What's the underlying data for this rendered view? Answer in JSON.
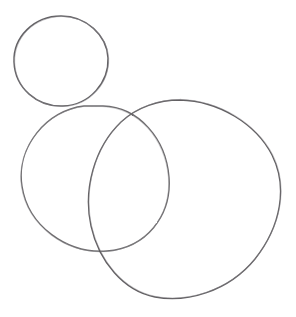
{
  "document": {
    "kind": "pencil-sketch",
    "title": "Three overlapping hand-drawn circles",
    "medium": "graphite pencil on paper",
    "width": 296,
    "height": 317,
    "background_color": "#ffffff",
    "paper_tint": "#fdfdfd",
    "stroke_color": "#5a585a",
    "stroke_color_light": "#8b898c",
    "stroke_width": 1.3
  },
  "shapes": [
    {
      "id": "small-circle",
      "name": "small-circle-top-left",
      "label": "Small circle (head)",
      "type": "circle",
      "cx": 61,
      "cy": 61,
      "rx": 47,
      "ry": 45,
      "rotation": -8,
      "bounds": {
        "left": 14,
        "top": 16,
        "right": 108,
        "bottom": 106
      },
      "stroke_color": "#565458",
      "stroke_width": 1.4,
      "path": "M 61 16 C 86 16 107 35 108 58 C 109 82 90 105 63 106 C 37 107 15 88 14 62 C 13 37 34 16 61 16 Z"
    },
    {
      "id": "middle-circle",
      "name": "middle-circle-lower-left",
      "label": "Medium circle (body, left)",
      "type": "circle",
      "cx": 95,
      "cy": 179,
      "rx": 74,
      "ry": 73,
      "rotation": 4,
      "bounds": {
        "left": 21,
        "top": 106,
        "right": 169,
        "bottom": 252
      },
      "stroke_color": "#5d5b5e",
      "stroke_width": 1.3,
      "path": "M 103 106 C 139 107 166 139 169 177 C 172 216 146 248 107 251 C 67 254 28 226 22 186 C 16 147 47 110 84 106 Z"
    },
    {
      "id": "large-ellipse",
      "name": "large-ellipse-right",
      "label": "Large tilted ellipse (body, right)",
      "type": "ellipse",
      "cx": 184,
      "cy": 200,
      "rx": 98,
      "ry": 77,
      "rotation": -20,
      "bounds": {
        "left": 88,
        "top": 100,
        "right": 280,
        "bottom": 300
      },
      "stroke_color": "#555356",
      "stroke_width": 1.3,
      "path": "M 180 100 C 219 101 256 124 272 155 C 288 187 281 226 255 259 C 228 292 186 303 155 297 C 124 291 99 262 91 226 C 83 190 94 148 121 122 C 137 107 159 100 180 100 Z"
    }
  ],
  "intersections": [
    {
      "name": "small-middle-tangent",
      "x": 63,
      "y": 107
    },
    {
      "name": "middle-large-upper",
      "x": 117,
      "y": 112
    },
    {
      "name": "middle-large-lower",
      "x": 116,
      "y": 250
    }
  ],
  "overlay_text": []
}
